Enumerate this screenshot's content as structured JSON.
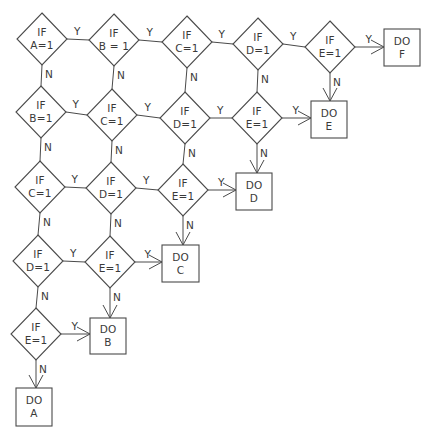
{
  "diagram": {
    "type": "flowchart",
    "colors": {
      "line": "#4a4a4a",
      "text": "#3a3a3a",
      "background": "#ffffff"
    },
    "decisions": [
      {
        "id": "r1a",
        "line1": "IF",
        "line2": "A=1",
        "cx": 42,
        "cy": 39,
        "yes": "r1b",
        "no": "r2a"
      },
      {
        "id": "r1b",
        "line1": "IF",
        "line2": "B = 1",
        "cx": 114,
        "cy": 40,
        "yes": "r1c",
        "no": "r2b"
      },
      {
        "id": "r1c",
        "line1": "IF",
        "line2": "C=1",
        "cx": 187,
        "cy": 42,
        "yes": "r1d",
        "no": "r2c"
      },
      {
        "id": "r1d",
        "line1": "IF",
        "line2": "D=1",
        "cx": 258,
        "cy": 44,
        "yes": "r1e",
        "no": "r2d"
      },
      {
        "id": "r1e",
        "line1": "IF",
        "line2": "E=1",
        "cx": 330,
        "cy": 47,
        "yes": "doF",
        "no": "doE"
      },
      {
        "id": "r2a",
        "line1": "IF",
        "line2": "B=1",
        "cx": 41,
        "cy": 112,
        "yes": "r2b",
        "no": "r3a"
      },
      {
        "id": "r2b",
        "line1": "IF",
        "line2": "C=1",
        "cx": 112,
        "cy": 115,
        "yes": "r2c",
        "no": "r3b"
      },
      {
        "id": "r2c",
        "line1": "IF",
        "line2": "D=1",
        "cx": 185,
        "cy": 118,
        "yes": "r2d",
        "no": "r3c"
      },
      {
        "id": "r2d",
        "line1": "IF",
        "line2": "E=1",
        "cx": 257,
        "cy": 118,
        "yes": "doE",
        "no": "doD"
      },
      {
        "id": "r3a",
        "line1": "IF",
        "line2": "C=1",
        "cx": 40,
        "cy": 187,
        "yes": "r3b",
        "no": "r4a"
      },
      {
        "id": "r3b",
        "line1": "IF",
        "line2": "D=1",
        "cx": 111,
        "cy": 188,
        "yes": "r3c",
        "no": "r4b"
      },
      {
        "id": "r3c",
        "line1": "IF",
        "line2": "E=1",
        "cx": 183,
        "cy": 190,
        "yes": "doD",
        "no": "doC"
      },
      {
        "id": "r4a",
        "line1": "IF",
        "line2": "D=1",
        "cx": 38,
        "cy": 261,
        "yes": "r4b",
        "no": "r5a"
      },
      {
        "id": "r4b",
        "line1": "IF",
        "line2": "E=1",
        "cx": 110,
        "cy": 262,
        "yes": "doC",
        "no": "doB"
      },
      {
        "id": "r5a",
        "line1": "IF",
        "line2": "E=1",
        "cx": 36,
        "cy": 334,
        "yes": "doB",
        "no": "doA"
      }
    ],
    "actions": [
      {
        "id": "doF",
        "line1": "DO",
        "line2": "F",
        "x": 384,
        "y": 29,
        "w": 36,
        "h": 37
      },
      {
        "id": "doE",
        "line1": "DO",
        "line2": "E",
        "x": 311,
        "y": 101,
        "w": 36,
        "h": 37
      },
      {
        "id": "doD",
        "line1": "DO",
        "line2": "D",
        "x": 236,
        "y": 173,
        "w": 36,
        "h": 37
      },
      {
        "id": "doC",
        "line1": "DO",
        "line2": "C",
        "x": 162,
        "y": 245,
        "w": 37,
        "h": 37
      },
      {
        "id": "doB",
        "line1": "DO",
        "line2": "B",
        "x": 90,
        "y": 318,
        "w": 36,
        "h": 36
      },
      {
        "id": "doA",
        "line1": "DO",
        "line2": "A",
        "x": 16,
        "y": 388,
        "w": 36,
        "h": 38
      }
    ],
    "edge_labels": {
      "yes": "Y",
      "no": "N"
    },
    "diamond_half_width": 25,
    "diamond_half_height": 26
  }
}
